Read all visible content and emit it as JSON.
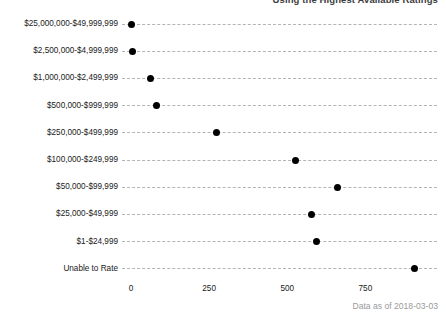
{
  "chart_data": {
    "type": "scatter",
    "title": "Using the Highest Available Ratings",
    "subtitle": "",
    "caption": "Data as of 2018-03-03",
    "xlabel": "",
    "ylabel": "",
    "orientation": "horizontal",
    "grid": "dashed horizontal category lines",
    "legend": "none",
    "xlim": [
      0,
      950
    ],
    "xticks": [
      0,
      250,
      500,
      750
    ],
    "xtick_labels": [
      "0",
      "250",
      "500",
      "750"
    ],
    "categories": [
      "$25,000,000-$49,999,999",
      "$2,500,000-$4,999,999",
      "$1,000,000-$2,499,999",
      "$500,000-$999,999",
      "$250,000-$499,999",
      "$100,000-$249,999",
      "$50,000-$99,999",
      "$25,000-$49,999",
      "$1-$24,999",
      "Unable to Rate"
    ],
    "values": [
      3,
      5,
      61,
      83,
      272,
      525,
      660,
      577,
      592,
      908
    ],
    "marker": "filled-circle",
    "marker_color": "#000000",
    "line_color": "#b4b4b4"
  }
}
